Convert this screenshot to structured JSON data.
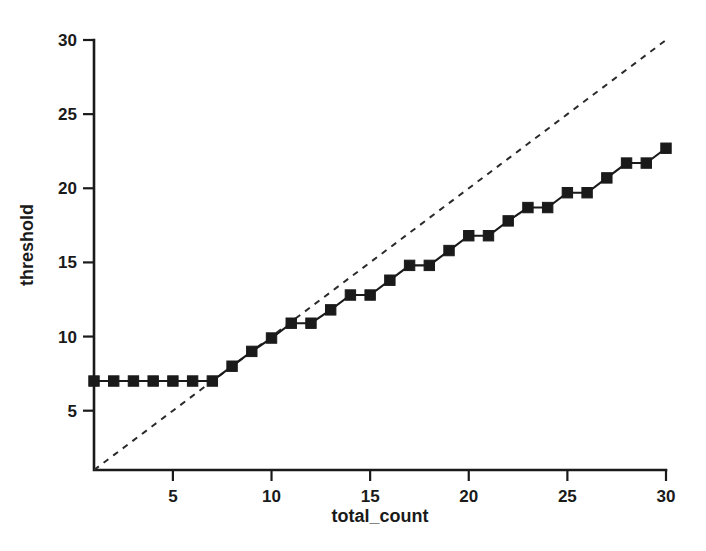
{
  "chart_data": {
    "type": "line",
    "title": "",
    "xlabel": "total_count",
    "ylabel": "threshold",
    "xlim": [
      1,
      30
    ],
    "ylim": [
      1,
      30
    ],
    "xticks": [
      5,
      10,
      15,
      20,
      25,
      30
    ],
    "xtick_labels": [
      "5",
      "10",
      "15",
      "20",
      "25",
      "30"
    ],
    "yticks": [
      5,
      10,
      15,
      20,
      25,
      30
    ],
    "ytick_labels": [
      "5",
      "10",
      "15",
      "20",
      "25",
      "30"
    ],
    "grid": false,
    "legend": "none",
    "x": [
      1,
      2,
      3,
      4,
      5,
      6,
      7,
      8,
      9,
      10,
      11,
      12,
      13,
      14,
      15,
      16,
      17,
      18,
      19,
      20,
      21,
      22,
      23,
      24,
      25,
      26,
      27,
      28,
      29,
      30
    ],
    "series": [
      {
        "name": "threshold",
        "style": "solid-with-square-markers",
        "color": "#1a1a1a",
        "marker": "square",
        "values": [
          7.0,
          7.0,
          7.0,
          7.0,
          7.0,
          7.0,
          7.0,
          8.0,
          9.0,
          9.9,
          10.9,
          10.9,
          11.8,
          12.8,
          12.8,
          13.8,
          14.8,
          14.8,
          15.8,
          16.8,
          16.8,
          17.8,
          18.7,
          18.7,
          19.7,
          19.7,
          20.7,
          21.7,
          21.7,
          22.7
        ]
      },
      {
        "name": "identity-reference",
        "style": "dashed",
        "color": "#2a2a2a",
        "marker": "none",
        "values": [
          1,
          2,
          3,
          4,
          5,
          6,
          7,
          8,
          9,
          10,
          11,
          12,
          13,
          14,
          15,
          16,
          17,
          18,
          19,
          20,
          21,
          22,
          23,
          24,
          25,
          26,
          27,
          28,
          29,
          30
        ]
      }
    ]
  },
  "axes": {
    "x_title": "total_count",
    "y_title": "threshold"
  }
}
